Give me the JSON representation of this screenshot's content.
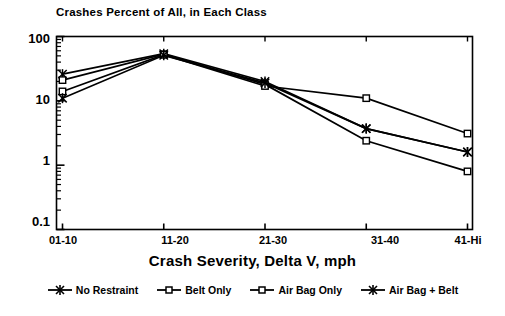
{
  "chart_data": {
    "type": "line",
    "title": "Crashes Percent of All, in Each Class",
    "xlabel": "Crash Severity, Delta V, mph",
    "ylabel": "",
    "categories": [
      "01-10",
      "11-20",
      "21-30",
      "31-40",
      "41-Hi"
    ],
    "yscale": "log",
    "ylim": [
      0.1,
      100
    ],
    "ytick_labels": [
      "100",
      "10",
      "1",
      "0.1"
    ],
    "ytick_values": [
      100,
      10,
      1,
      0.1
    ],
    "grid": false,
    "legend_position": "below",
    "series": [
      {
        "name": "No Restraint",
        "marker": "asterisk",
        "values": [
          26,
          54,
          20,
          3.7,
          1.6
        ]
      },
      {
        "name": "Belt Only",
        "marker": "square",
        "values": [
          21,
          53,
          18,
          2.4,
          0.8
        ]
      },
      {
        "name": "Air Bag Only",
        "marker": "square",
        "values": [
          14,
          52,
          17,
          11,
          3.1
        ]
      },
      {
        "name": "Air Bag + Belt",
        "marker": "asterisk",
        "values": [
          11,
          51,
          19,
          3.7,
          1.6
        ]
      }
    ]
  },
  "axis": {
    "y_ticks": [
      {
        "label": "100",
        "value": 100
      },
      {
        "label": "10",
        "value": 10
      },
      {
        "label": "1",
        "value": 1
      },
      {
        "label": "0.1",
        "value": 0.1
      }
    ],
    "x_ticks": [
      {
        "label": "01-10"
      },
      {
        "label": "11-20"
      },
      {
        "label": "21-30"
      },
      {
        "label": "31-40"
      },
      {
        "label": "41-Hi"
      }
    ]
  },
  "legend": {
    "items": [
      {
        "label": "No Restraint",
        "marker": "asterisk"
      },
      {
        "label": "Belt Only",
        "marker": "square"
      },
      {
        "label": "Air Bag Only",
        "marker": "square"
      },
      {
        "label": "Air Bag + Belt",
        "marker": "asterisk"
      }
    ]
  },
  "colors": {
    "ink": "#000000",
    "background": "#ffffff"
  }
}
